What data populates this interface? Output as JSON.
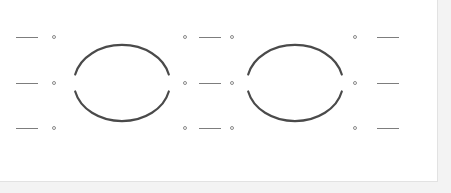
{
  "document": {
    "title": "Structure Drawing Canvas",
    "background_color": "#ffffff",
    "backdrop_color": "#f3f3f3",
    "panel_border_color": "#e2e2e2",
    "panel_width": 438,
    "panel_height": 182
  },
  "style": {
    "arc_color": "#4a4a4a",
    "arc_stroke_width": 2.2,
    "dash_color": "#7d7d7d",
    "dash_stroke_width": 1,
    "circle_color": "#8b8b8b",
    "circle_diameter": 4
  },
  "chart_data": {
    "type": "diagram",
    "xlabel": "",
    "ylabel": "",
    "row_centers_y": [
      37,
      83,
      128
    ],
    "columns": [
      {
        "name": "far-left-dash-column",
        "kind": "dash",
        "x_start": 16,
        "x_end": 38
      },
      {
        "name": "left-inner-circle-column",
        "kind": "circle",
        "x": 54
      },
      {
        "name": "mid-left-circle-column",
        "kind": "circle",
        "x": 185
      },
      {
        "name": "mid-dash-column",
        "kind": "dash",
        "x_start": 199,
        "x_end": 221
      },
      {
        "name": "mid-right-circle-column",
        "kind": "circle",
        "x": 232
      },
      {
        "name": "right-inner-circle-column",
        "kind": "circle",
        "x": 355
      },
      {
        "name": "far-right-dash-column",
        "kind": "dash",
        "x_start": 377,
        "x_end": 399
      }
    ],
    "ellipses": [
      {
        "name": "left-ring",
        "center_x": 122,
        "center_y": 83,
        "radius_x": 48,
        "radius_y": 38,
        "split": "horizontal",
        "gap_degrees": 26,
        "arcs": [
          "top",
          "bottom"
        ]
      },
      {
        "name": "right-ring",
        "center_x": 295,
        "center_y": 83,
        "radius_x": 48,
        "radius_y": 38,
        "split": "horizontal",
        "gap_degrees": 26,
        "arcs": [
          "top",
          "bottom"
        ]
      }
    ],
    "marker_grid": {
      "rows": 3,
      "circle_columns": 4,
      "dash_columns": 3,
      "total_circles": 12,
      "total_dashes": 9
    }
  }
}
